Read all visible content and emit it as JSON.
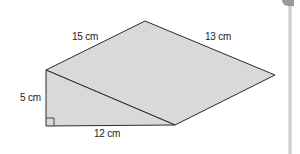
{
  "diagram": {
    "type": "triangular-prism",
    "labels": {
      "slant_top_left": "15 cm",
      "slant_top_right": "13 cm",
      "height": "5 cm",
      "base": "12 cm"
    },
    "right_angle_marker": true,
    "colors": {
      "fill": "#d9d9d9",
      "stroke": "#2b2b2b",
      "background": "#ffffff"
    }
  }
}
